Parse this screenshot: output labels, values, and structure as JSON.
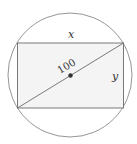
{
  "diagram": {
    "labels": {
      "top_side": "x",
      "right_side": "y",
      "diagonal": "100"
    },
    "colors": {
      "stroke": "#6b6b6b",
      "rect_fill": "#f4f4f4",
      "center_dot": "#333333"
    }
  }
}
